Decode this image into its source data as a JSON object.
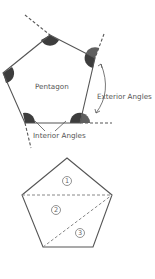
{
  "figure": {
    "top_diagram": {
      "shape_label": "Pentagon",
      "exterior_label": "Exterior Angles",
      "interior_label": "Interior Angles",
      "colors": {
        "interior_wedge": "#3d3d3d",
        "exterior_wedge": "#5f5f5f",
        "lines": "#555555"
      }
    },
    "bottom_diagram": {
      "triangle_labels": [
        "1",
        "2",
        "3"
      ],
      "colors": {
        "lines": "#555555",
        "diagonals": "#888888"
      }
    }
  }
}
